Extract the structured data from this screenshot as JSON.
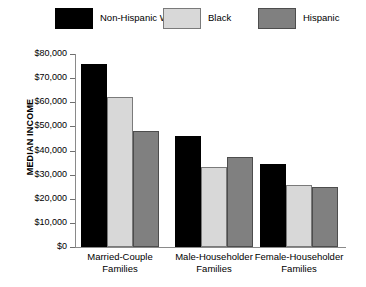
{
  "legend": {
    "items": [
      {
        "label": "Non-Hispanic White",
        "color": "#000000",
        "border": "#000000"
      },
      {
        "label": "Black",
        "color": "#d8d8d8",
        "border": "#7a7a7a"
      },
      {
        "label": "Hispanic",
        "color": "#808080",
        "border": "#4d4d4d"
      }
    ]
  },
  "axis": {
    "y_title": "MEDIAN INCOME",
    "tick_labels": [
      "$80,000",
      "$70,000",
      "$60,000",
      "$50,000",
      "$40,000",
      "$30,000",
      "$20,000",
      "$10,000",
      "$0"
    ]
  },
  "caption_fragment": "",
  "chart_data": {
    "type": "bar",
    "title": "",
    "xlabel": "",
    "ylabel": "MEDIAN INCOME",
    "ylim": [
      0,
      80000
    ],
    "ytick_step": 10000,
    "grid": false,
    "legend_position": "top",
    "categories": [
      "Married-Couple Families",
      "Male-Householder Families",
      "Female-Householder Families"
    ],
    "category_lines": [
      [
        "Married-Couple",
        "Families"
      ],
      [
        "Male-Householder",
        "Families"
      ],
      [
        "Female-Householder",
        "Families"
      ]
    ],
    "series": [
      {
        "name": "Non-Hispanic White",
        "color": "#000000",
        "values": [
          76000,
          46000,
          34500
        ]
      },
      {
        "name": "Black",
        "color": "#d8d8d8",
        "values": [
          62000,
          33000,
          25500
        ]
      },
      {
        "name": "Hispanic",
        "color": "#808080",
        "values": [
          48000,
          37500,
          25000
        ]
      }
    ]
  }
}
